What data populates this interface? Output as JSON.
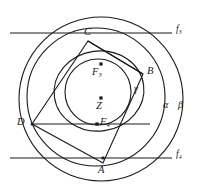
{
  "figure": {
    "type": "geometry-diagram",
    "background": "#ffffff",
    "stroke_color": "#1a1a1a",
    "width": 198,
    "height": 186
  },
  "points": [
    {
      "id": "A",
      "label": "A",
      "x": 103,
      "y": 163,
      "label_x": 99,
      "label_y": 166,
      "marker": false,
      "desc": "vertex on bottom line f4"
    },
    {
      "id": "B",
      "label": "B",
      "x": 143,
      "y": 74,
      "label_x": 146,
      "label_y": 69,
      "marker": false,
      "desc": "vertex on right"
    },
    {
      "id": "C",
      "label": "C",
      "x": 88,
      "y": 41,
      "label_x": 84,
      "label_y": 29,
      "marker": false,
      "desc": "vertex on top"
    },
    {
      "id": "D",
      "label": "D",
      "x": 32,
      "y": 124,
      "label_x": 18,
      "label_y": 119,
      "marker": false,
      "desc": "vertex on left"
    },
    {
      "id": "F3",
      "label": "F",
      "sub": "3",
      "x": 101,
      "y": 65,
      "label_x": 94,
      "label_y": 68,
      "marker": true,
      "desc": "focus F3 with dot"
    },
    {
      "id": "Z",
      "label": "Z",
      "x": 101,
      "y": 99,
      "label_x": 97,
      "label_y": 102,
      "marker": true,
      "desc": "center Z with dot"
    },
    {
      "id": "F4",
      "label": "F",
      "sub": "4",
      "x": 101,
      "y": 124,
      "label_x": 102,
      "label_y": 119,
      "marker": true,
      "desc": "focus F4 with dot"
    }
  ],
  "curves": [
    {
      "id": "beta",
      "label": "β",
      "type": "circle",
      "cx": 101,
      "cy": 99,
      "r": 82,
      "label_x": 180,
      "label_y": 105,
      "desc": "outermost circle beta"
    },
    {
      "id": "alpha",
      "label": "α",
      "type": "circle",
      "cx": 96,
      "cy": 97,
      "r": 69,
      "label_x": 165,
      "label_y": 105,
      "desc": "circle alpha"
    },
    {
      "id": "gamma",
      "label": "γ",
      "type": "ellipse",
      "cx": 99,
      "cy": 91,
      "rx": 45,
      "ry": 40,
      "rot": -8,
      "label_x": 137,
      "label_y": 87,
      "desc": "oval gamma through C, B, D"
    },
    {
      "id": "inner",
      "label": "",
      "type": "circle",
      "cx": 98,
      "cy": 92,
      "r": 33,
      "label_x": 0,
      "label_y": 0,
      "desc": "innermost circle, unlabeled"
    }
  ],
  "lines": [
    {
      "id": "f3",
      "label": "f",
      "sub": "3",
      "x1": 10,
      "y1": 33,
      "x2": 172,
      "y2": 33,
      "label_x": 176,
      "label_y": 27,
      "desc": "upper horizontal line f3"
    },
    {
      "id": "f4",
      "label": "f",
      "sub": "4",
      "x1": 10,
      "y1": 158,
      "x2": 172,
      "y2": 158,
      "label_x": 176,
      "label_y": 152,
      "desc": "lower horizontal line f4"
    },
    {
      "id": "dl",
      "label": "",
      "x1": 32,
      "y1": 124,
      "x2": 150,
      "y2": 124,
      "desc": "horizontal chord through D and F4"
    }
  ],
  "quadrilateral": {
    "id": "ABCD",
    "vertices": [
      "C",
      "B",
      "A",
      "D"
    ],
    "desc": "quadrilateral C-B-A-D-C inscribed in oval"
  },
  "labels": {
    "A": "A",
    "B": "B",
    "C": "C",
    "D": "D",
    "Z": "Z",
    "F3": "F3",
    "F4": "F4",
    "alpha": "α",
    "beta": "β",
    "gamma": "γ",
    "f3": "f3",
    "f4": "f4"
  }
}
